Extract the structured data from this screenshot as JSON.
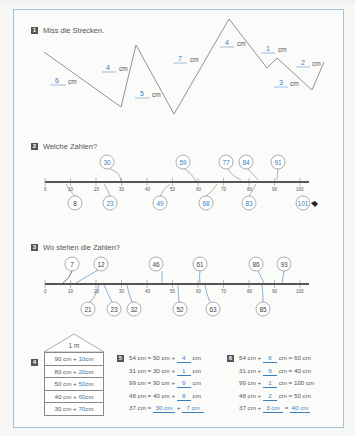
{
  "page": {
    "frame_color": "#9fc3dd",
    "answer_color": "#3a7fc2"
  },
  "ex1": {
    "number": "1",
    "title": "Miss die Strecken.",
    "unit": "cm",
    "segments": [
      {
        "answer": "6",
        "unit": "cm"
      },
      {
        "answer": "4",
        "unit": "cm"
      },
      {
        "answer": "5",
        "unit": "cm"
      },
      {
        "answer": "7",
        "unit": "cm"
      },
      {
        "answer": "4",
        "unit": "cm"
      },
      {
        "answer": "1",
        "unit": "cm"
      },
      {
        "answer": "3",
        "unit": "cm"
      },
      {
        "answer": "2",
        "unit": "cm"
      }
    ]
  },
  "ex2": {
    "number": "2",
    "title": "Welche Zahlen?",
    "ticks": [
      "0",
      "10",
      "20",
      "30",
      "40",
      "50",
      "60",
      "70",
      "80",
      "90",
      "100"
    ],
    "above": [
      "30",
      "59",
      "77",
      "84",
      "91"
    ],
    "below": [
      "8",
      "23",
      "49",
      "68",
      "83",
      "101"
    ],
    "example": "8"
  },
  "ex3": {
    "number": "3",
    "title": "Wo stehen die Zahlen?",
    "ticks": [
      "0",
      "10",
      "20",
      "30",
      "40",
      "50",
      "60",
      "70",
      "80",
      "90",
      "100"
    ],
    "above": [
      "7",
      "12",
      "46",
      "61",
      "86",
      "93"
    ],
    "below": [
      "21",
      "23",
      "32",
      "52",
      "63",
      "85"
    ]
  },
  "ex4": {
    "number": "4",
    "roof": "1 m",
    "rows": [
      {
        "given": "90 cm +",
        "answer": "10",
        "unit": "cm"
      },
      {
        "given": "80 cm +",
        "answer": "20",
        "unit": "cm"
      },
      {
        "given": "50 cm +",
        "answer": "50",
        "unit": "cm"
      },
      {
        "given": "40 cm +",
        "answer": "60",
        "unit": "cm"
      },
      {
        "given": "30 cm +",
        "answer": "70",
        "unit": "cm"
      }
    ]
  },
  "ex5": {
    "number": "5",
    "rows": [
      {
        "left": "54 cm =",
        "mid": "50 cm +",
        "answer": "4",
        "unit": "cm"
      },
      {
        "left": "31 cm =",
        "mid": "30 cm +",
        "answer": "1",
        "unit": "cm"
      },
      {
        "left": "99 cm =",
        "mid": "90 cm +",
        "answer": "9",
        "unit": "cm"
      },
      {
        "left": "48 cm =",
        "mid": "40 cm +",
        "answer": "8",
        "unit": "cm"
      },
      {
        "left": "37 cm =",
        "answer1": "30 cm",
        "plus": "+",
        "answer2": "7 cm"
      }
    ]
  },
  "ex6": {
    "number": "6",
    "rows": [
      {
        "left": "54 cm +",
        "answer": "6",
        "mid": "cm =",
        "right": "60 cm"
      },
      {
        "left": "31 cm +",
        "answer": "9",
        "mid": "cm =",
        "right": "40 cm"
      },
      {
        "left": "99 cm +",
        "answer": "1",
        "mid": "cm =",
        "right": "100 cm"
      },
      {
        "left": "48 cm +",
        "answer": "2",
        "mid": "cm =",
        "right": "50 cm"
      },
      {
        "left": "37 cm +",
        "answer1": "3 cm",
        "eq": "=",
        "answer2": "40 cm"
      }
    ]
  }
}
